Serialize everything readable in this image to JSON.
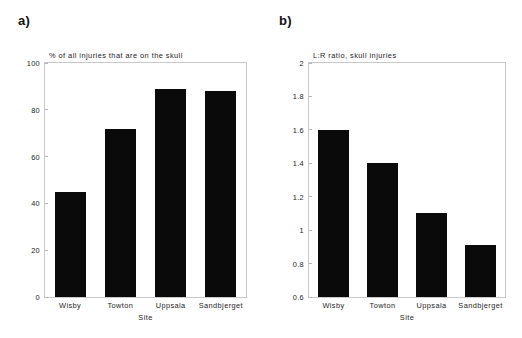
{
  "figure": {
    "panels": [
      {
        "label": "a)",
        "title": "% of all injuries that are on the skull",
        "xlabel": "Site",
        "yticks": [
          "0",
          "20",
          "40",
          "60",
          "80",
          "100"
        ]
      },
      {
        "label": "b)",
        "title": "L:R ratio, skull injuries",
        "xlabel": "Site",
        "yticks": [
          "0.6",
          "0.8",
          "1",
          "1.2",
          "1.4",
          "1.6",
          "1.8",
          "2"
        ]
      }
    ]
  },
  "chart_data": [
    {
      "type": "bar",
      "title": "% of all injuries that are on the skull",
      "panel": "a)",
      "categories": [
        "Wisby",
        "Towton",
        "Uppsala",
        "Sandbjerget"
      ],
      "values": [
        45,
        72,
        89,
        88
      ],
      "xlabel": "Site",
      "ylabel": "",
      "ylim": [
        0,
        100
      ],
      "yticks": [
        0,
        20,
        40,
        60,
        80,
        100
      ],
      "grid": false,
      "legend": false,
      "bar_color": "#0a0a0a"
    },
    {
      "type": "bar",
      "title": "L:R ratio, skull injuries",
      "panel": "b)",
      "categories": [
        "Wisby",
        "Towton",
        "Uppsala",
        "Sandbjerget"
      ],
      "values": [
        1.6,
        1.4,
        1.1,
        0.91
      ],
      "xlabel": "Site",
      "ylabel": "",
      "ylim": [
        0.6,
        2
      ],
      "yticks": [
        0.6,
        0.8,
        1,
        1.2,
        1.4,
        1.6,
        1.8,
        2
      ],
      "grid": false,
      "legend": false,
      "bar_color": "#0a0a0a"
    }
  ]
}
